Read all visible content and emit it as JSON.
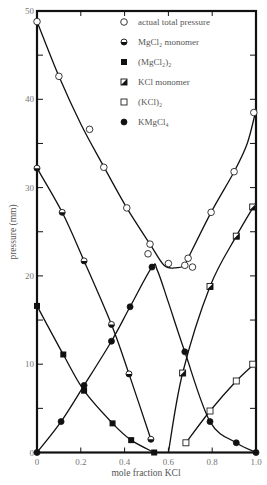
{
  "chart_data": {
    "type": "scatter",
    "title": "",
    "xlabel": "mole fraction KCl",
    "ylabel": "pressure (mm)",
    "xlim": [
      0,
      1.0
    ],
    "ylim": [
      0,
      50
    ],
    "grid": false,
    "legend_position": "top-right",
    "x_ticks": [
      "0",
      "0.2",
      "0.4",
      "0.6",
      "0.8",
      "1.0"
    ],
    "x_tick_values": [
      0,
      0.2,
      0.4,
      0.6,
      0.8,
      1.0
    ],
    "y_ticks": [
      "0",
      "10",
      "20",
      "30",
      "40",
      "50"
    ],
    "y_tick_values": [
      0,
      10,
      20,
      30,
      40,
      50
    ],
    "series": [
      {
        "name": "actual total pressure",
        "marker": "open-circle",
        "points": [
          [
            0,
            48.8
          ],
          [
            0.1,
            42.6
          ],
          [
            0.24,
            36.6
          ],
          [
            0.305,
            32.3
          ],
          [
            0.41,
            27.7
          ],
          [
            0.507,
            22.5
          ],
          [
            0.516,
            23.6
          ],
          [
            0.6,
            21.4
          ],
          [
            0.675,
            21.2
          ],
          [
            0.69,
            22.0
          ],
          [
            0.71,
            21.0
          ],
          [
            0.795,
            27.2
          ],
          [
            0.9,
            31.8
          ],
          [
            0.99,
            38.5
          ]
        ],
        "curve": [
          [
            0,
            48.8
          ],
          [
            0.1,
            42.6
          ],
          [
            0.2,
            37.2
          ],
          [
            0.3,
            32.6
          ],
          [
            0.41,
            27.7
          ],
          [
            0.516,
            23.6
          ],
          [
            0.58,
            21.2
          ],
          [
            0.63,
            20.9
          ],
          [
            0.675,
            21.2
          ],
          [
            0.69,
            22.0
          ],
          [
            0.795,
            27.2
          ],
          [
            0.9,
            31.8
          ],
          [
            0.96,
            35.0
          ],
          [
            1.0,
            38.8
          ]
        ]
      },
      {
        "name": "MgCl₂ monomer",
        "marker": "half-filled-circle",
        "points": [
          [
            0,
            32.2
          ],
          [
            0.115,
            27.2
          ],
          [
            0.215,
            21.7
          ],
          [
            0.34,
            14.5
          ],
          [
            0.42,
            8.9
          ],
          [
            0.52,
            1.5
          ]
        ],
        "curve": [
          [
            0,
            32.2
          ],
          [
            0.115,
            27.2
          ],
          [
            0.215,
            21.7
          ],
          [
            0.34,
            14.5
          ],
          [
            0.42,
            8.9
          ],
          [
            0.52,
            1.5
          ]
        ]
      },
      {
        "name": "(MgCl₂)₂",
        "marker": "filled-square",
        "points": [
          [
            0,
            16.6
          ],
          [
            0.12,
            11.1
          ],
          [
            0.215,
            7.0
          ],
          [
            0.345,
            3.3
          ],
          [
            0.43,
            1.4
          ],
          [
            0.535,
            0
          ]
        ],
        "curve": [
          [
            0,
            16.6
          ],
          [
            0.12,
            11.1
          ],
          [
            0.215,
            7.0
          ],
          [
            0.345,
            3.3
          ],
          [
            0.43,
            1.4
          ],
          [
            0.535,
            0
          ]
        ]
      },
      {
        "name": "KCl monomer",
        "marker": "half-filled-square",
        "points": [
          [
            0.665,
            9.0
          ],
          [
            0.79,
            18.8
          ],
          [
            0.91,
            24.5
          ],
          [
            0.985,
            27.8
          ]
        ],
        "curve": [
          [
            0.6,
            0
          ],
          [
            0.665,
            9.0
          ],
          [
            0.79,
            18.8
          ],
          [
            0.91,
            24.5
          ],
          [
            1.0,
            28.3
          ]
        ]
      },
      {
        "name": "(KCl)₂",
        "marker": "open-square",
        "points": [
          [
            0.68,
            1.1
          ],
          [
            0.79,
            4.7
          ],
          [
            0.91,
            8.1
          ],
          [
            0.985,
            10.0
          ]
        ],
        "curve": [
          [
            0.68,
            1.1
          ],
          [
            0.79,
            4.7
          ],
          [
            0.91,
            8.1
          ],
          [
            1.0,
            10.2
          ]
        ]
      },
      {
        "name": "KMgCl₄",
        "marker": "filled-circle",
        "points": [
          [
            0,
            0
          ],
          [
            0.11,
            3.5
          ],
          [
            0.215,
            7.6
          ],
          [
            0.34,
            12.6
          ],
          [
            0.425,
            16.5
          ],
          [
            0.525,
            21.0
          ],
          [
            0.675,
            11.4
          ],
          [
            0.79,
            3.5
          ],
          [
            0.91,
            1.1
          ],
          [
            1.0,
            0
          ]
        ],
        "curve": [
          [
            0,
            0
          ],
          [
            0.11,
            3.5
          ],
          [
            0.215,
            7.6
          ],
          [
            0.34,
            12.6
          ],
          [
            0.425,
            16.5
          ],
          [
            0.525,
            21.0
          ],
          [
            0.55,
            20.6
          ],
          [
            0.6,
            17.0
          ],
          [
            0.675,
            11.4
          ],
          [
            0.79,
            3.5
          ],
          [
            0.91,
            1.1
          ],
          [
            1.0,
            0
          ]
        ]
      }
    ]
  }
}
